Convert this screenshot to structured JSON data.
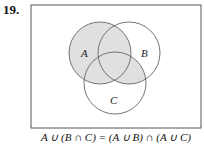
{
  "problem_number": "19.",
  "diagram": {
    "type": "venn",
    "sets": [
      {
        "label": "A",
        "cx": 100,
        "cy": 53,
        "r": 31
      },
      {
        "label": "B",
        "cx": 129,
        "cy": 53,
        "r": 31
      },
      {
        "label": "C",
        "cx": 115,
        "cy": 83,
        "r": 31
      }
    ],
    "shaded_region": "A ∪ (B ∩ C)",
    "shade_color": "#e0e0e0",
    "stroke_color": "#666666"
  },
  "labels": {
    "a": "A",
    "b": "B",
    "c": "C"
  },
  "caption": "A ∪ (B ∩ C) = (A ∪ B) ∩ (A ∪ C)"
}
